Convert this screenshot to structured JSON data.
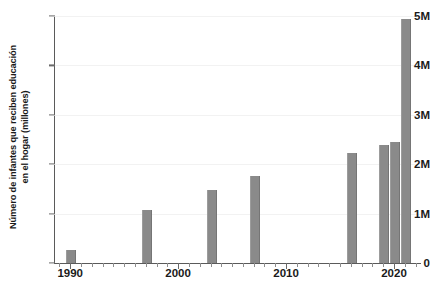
{
  "chart_data": {
    "type": "bar",
    "title": "",
    "xlabel": "",
    "ylabel": "Número de infantes que reciben educación en el hogar (millones)",
    "ylabel_line1": "Número de infantes que reciben educación",
    "ylabel_line2": "en el hogar (millones)",
    "x": [
      1990,
      1997,
      2003,
      2007,
      2016,
      2019,
      2020,
      2021
    ],
    "values": [
      0.27,
      1.07,
      1.47,
      1.76,
      2.23,
      2.39,
      2.45,
      4.94
    ],
    "categories": [
      "1990",
      "1997",
      "2003",
      "2007",
      "2016",
      "2019",
      "2020",
      "2021"
    ],
    "xlim": [
      1988.5,
      2022.5
    ],
    "ylim": [
      0,
      5
    ],
    "xticks": [
      1990,
      2000,
      2010,
      2020
    ],
    "xticklabels": [
      "1990",
      "2000",
      "2010",
      "2020"
    ],
    "yticks": [
      0,
      1,
      2,
      3,
      4,
      5
    ],
    "yticklabels": [
      "0",
      "1M",
      "2M",
      "3M",
      "4M",
      "5M"
    ],
    "grid": true,
    "legend": "none",
    "bar_color": "#8a8a8a",
    "axis_color": "#5a5a5a",
    "text_color": "#1a1a1a",
    "minor_tick_step": 1
  }
}
